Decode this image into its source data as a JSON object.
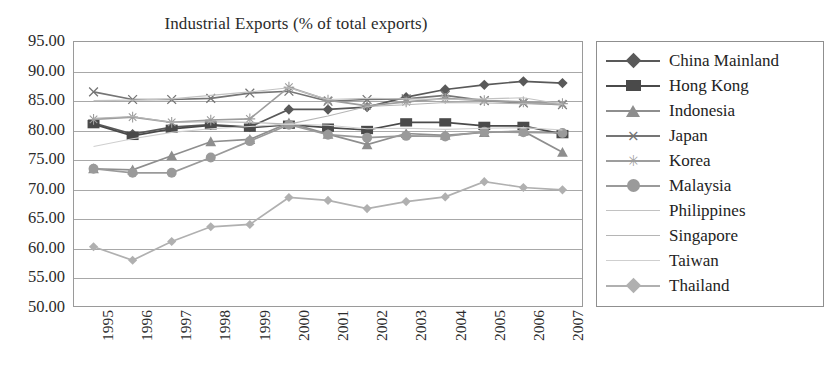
{
  "chart_data": {
    "type": "line",
    "title": "Industrial Exports (% of total exports)",
    "xlabel": "",
    "ylabel": "",
    "ylim": [
      50.0,
      95.0
    ],
    "ytick_step": 5.0,
    "grid": true,
    "legend_position": "right",
    "categories": [
      "1995",
      "1996",
      "1997",
      "1998",
      "1999",
      "2000",
      "2001",
      "2002",
      "2003",
      "2004",
      "2005",
      "2006",
      "2007"
    ],
    "ytick_labels": [
      "95.00",
      "90.00",
      "85.00",
      "80.00",
      "75.00",
      "70.00",
      "65.00",
      "60.00",
      "55.00",
      "50.00"
    ],
    "series": [
      {
        "name": "China Mainland",
        "marker": "diamond",
        "color": "#595959",
        "values": [
          81.2,
          79.3,
          80.5,
          80.9,
          80.5,
          83.5,
          83.5,
          83.9,
          85.6,
          86.9,
          87.7,
          88.3,
          88.0
        ]
      },
      {
        "name": "Hong Kong",
        "marker": "square",
        "color": "#4a4a4a",
        "values": [
          81.0,
          79.0,
          80.2,
          80.8,
          80.4,
          80.9,
          80.4,
          80.0,
          81.3,
          81.3,
          80.7,
          80.7,
          79.3
        ]
      },
      {
        "name": "Indonesia",
        "marker": "triangle",
        "color": "#8e8e8e",
        "values": [
          73.4,
          73.2,
          75.6,
          78.0,
          78.4,
          81.2,
          79.3,
          77.5,
          79.4,
          79.1,
          79.6,
          79.8,
          76.2
        ]
      },
      {
        "name": "Japan",
        "marker": "x",
        "color": "#757575",
        "values": [
          86.5,
          85.2,
          85.2,
          85.4,
          86.3,
          86.6,
          84.9,
          85.2,
          85.3,
          85.9,
          85.0,
          84.6,
          84.3
        ]
      },
      {
        "name": "Korea",
        "marker": "star",
        "color": "#9d9d9d",
        "values": [
          81.8,
          82.2,
          81.3,
          81.7,
          81.9,
          87.3,
          85.1,
          84.1,
          84.8,
          85.4,
          85.0,
          84.8,
          84.5
        ]
      },
      {
        "name": "Malaysia",
        "marker": "circle",
        "color": "#9a9a9a",
        "values": [
          73.4,
          72.7,
          72.7,
          75.3,
          78.1,
          80.9,
          79.2,
          78.7,
          79.0,
          78.9,
          79.7,
          79.6,
          79.5
        ]
      },
      {
        "name": "Philippines",
        "marker": "none",
        "color": "#c2c2c2",
        "values": [
          85.0,
          85.1,
          85.3,
          85.9,
          86.5,
          87.2,
          85.2,
          85.4,
          85.3,
          85.2,
          85.3,
          85.5,
          84.4
        ]
      },
      {
        "name": "Singapore",
        "marker": "none",
        "color": "#b5b5b5",
        "values": [
          82.0,
          82.3,
          81.3,
          81.4,
          81.3,
          81.0,
          82.4,
          84.0,
          84.3,
          84.7,
          84.6,
          84.5,
          84.4
        ]
      },
      {
        "name": "Taiwan",
        "marker": "none",
        "color": "#cfcfcf",
        "values": [
          77.2,
          78.5,
          79.6,
          80.2,
          80.6,
          81.0,
          80.8,
          80.2,
          80.3,
          80.1,
          80.3,
          80.4,
          80.0
        ]
      },
      {
        "name": "Thailand",
        "marker": "diamond-light",
        "color": "#b0b0b0",
        "values": [
          60.1,
          57.8,
          61.0,
          63.5,
          63.9,
          68.5,
          68.0,
          66.6,
          67.8,
          68.6,
          71.2,
          70.2,
          69.8
        ]
      }
    ]
  },
  "legend": {
    "items": [
      {
        "label": "China Mainland"
      },
      {
        "label": "Hong Kong"
      },
      {
        "label": "Indonesia"
      },
      {
        "label": "Japan"
      },
      {
        "label": "Korea"
      },
      {
        "label": "Malaysia"
      },
      {
        "label": "Philippines"
      },
      {
        "label": "Singapore"
      },
      {
        "label": "Taiwan"
      },
      {
        "label": "Thailand"
      }
    ]
  },
  "colors": {
    "plot_border": "#9a9a9a",
    "gridline": "#a8a8a8",
    "text": "#2b2b2b",
    "background": "#ffffff"
  }
}
